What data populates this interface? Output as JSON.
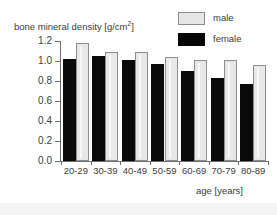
{
  "chart_data": {
    "type": "bar",
    "title": "",
    "ylabel": "bone mineral density [g/cm²]",
    "ylabel_text": "bone mineral density [g/cm",
    "ylabel_sup": "2",
    "ylabel_tail": "]",
    "xlabel": "age [years]",
    "categories": [
      "20-29",
      "30-39",
      "40-49",
      "50-59",
      "60-69",
      "70-79",
      "80-89"
    ],
    "series": [
      {
        "name": "male",
        "values": [
          1.18,
          1.09,
          1.09,
          1.04,
          1.01,
          1.01,
          0.96
        ],
        "color": "#e8e8e8"
      },
      {
        "name": "female",
        "values": [
          1.02,
          1.05,
          1.01,
          0.97,
          0.9,
          0.83,
          0.77
        ],
        "color": "#0a0a0a"
      }
    ],
    "ylim": [
      0.0,
      1.2
    ],
    "yticks": [
      "0.0",
      "0.2",
      "0.4",
      "0.6",
      "0.8",
      "1.0",
      "1.2"
    ],
    "ytick_values": [
      0.0,
      0.2,
      0.4,
      0.6,
      0.8,
      1.0,
      1.2
    ],
    "grid": false,
    "legend_position": "top-right"
  },
  "legend": {
    "entries": [
      {
        "label": "male",
        "swatch": "light-gray"
      },
      {
        "label": "female",
        "swatch": "black"
      }
    ]
  }
}
